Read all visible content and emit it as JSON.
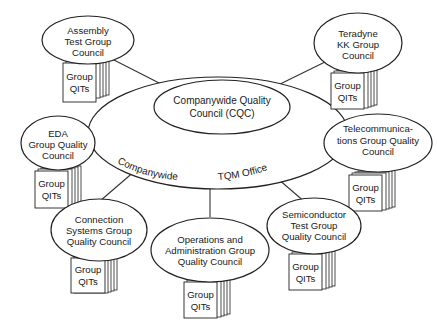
{
  "diagram": {
    "type": "organization-structure",
    "center": {
      "inner_label_lines": [
        "Companywide Quality",
        "Council (CQC)"
      ],
      "outer_label_left": "Companywide",
      "outer_label_right": "TQM Office"
    },
    "councils": [
      {
        "id": "assembly",
        "label_lines": [
          "Assembly",
          "Test Group",
          "Council"
        ],
        "qit_lines": [
          "Group",
          "QITs"
        ]
      },
      {
        "id": "teradyne-kk",
        "label_lines": [
          "Teradyne",
          "KK Group",
          "Council"
        ],
        "qit_lines": [
          "Group",
          "QITs"
        ]
      },
      {
        "id": "eda",
        "label_lines": [
          "EDA",
          "Group Quality",
          "Council"
        ],
        "qit_lines": [
          "Group",
          "QITs"
        ]
      },
      {
        "id": "telecom",
        "label_lines": [
          "Telecommunica-",
          "tions Group Quality",
          "Council"
        ],
        "qit_lines": [
          "Group",
          "QITs"
        ]
      },
      {
        "id": "connection",
        "label_lines": [
          "Connection",
          "Systems Group",
          "Quality Council"
        ],
        "qit_lines": [
          "Group",
          "QITs"
        ]
      },
      {
        "id": "operations",
        "label_lines": [
          "Operations and",
          "Administration Group",
          "Quality Council"
        ],
        "qit_lines": [
          "Group",
          "QITs"
        ]
      },
      {
        "id": "semiconductor",
        "label_lines": [
          "Semiconductor",
          "Test Group",
          "Quality Council"
        ],
        "qit_lines": [
          "Group",
          "QITs"
        ]
      }
    ]
  }
}
